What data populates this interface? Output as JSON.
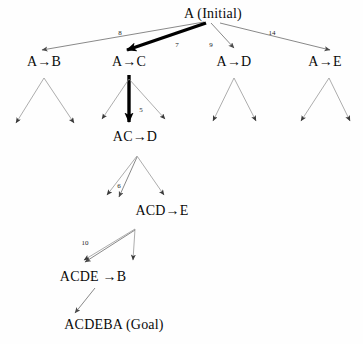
{
  "diagram": {
    "title_node": "A (Initial)",
    "goal_node": "ACDEBA (Goal)",
    "arrow_glyph": "→",
    "colors": {
      "background": "#fefefe",
      "text": "#0a0a0a",
      "thin_edge": "#6b6b6b",
      "bold_edge": "#000000"
    },
    "nodes": [
      {
        "id": "root",
        "label": "A (Initial)",
        "x": 213,
        "y": 14,
        "level": 0
      },
      {
        "id": "n_ab",
        "label": "A→B",
        "x": 44,
        "y": 62,
        "level": 1
      },
      {
        "id": "n_ac",
        "label": "A→C",
        "x": 129,
        "y": 62,
        "level": 1
      },
      {
        "id": "n_ad",
        "label": "A→D",
        "x": 234,
        "y": 62,
        "level": 1
      },
      {
        "id": "n_ae",
        "label": "A→E",
        "x": 325,
        "y": 62,
        "level": 1
      },
      {
        "id": "n_acd",
        "label": "AC→D",
        "x": 135,
        "y": 137,
        "level": 2
      },
      {
        "id": "n_acde",
        "label": "ACD→E",
        "x": 162,
        "y": 211,
        "level": 3
      },
      {
        "id": "n_acdeb",
        "label": "ACDE →B",
        "x": 93,
        "y": 277,
        "level": 4
      },
      {
        "id": "goal",
        "label": "ACDEBA (Goal)",
        "x": 114,
        "y": 325,
        "level": 5
      }
    ],
    "edges": [
      {
        "id": "e_root_ab",
        "from": "root",
        "to": "n_ab",
        "weight": "8",
        "bold": false,
        "lx": 120,
        "ly": 33
      },
      {
        "id": "e_root_ac",
        "from": "root",
        "to": "n_ac",
        "weight": "7",
        "bold": true,
        "lx": 177,
        "ly": 45
      },
      {
        "id": "e_root_ad",
        "from": "root",
        "to": "n_ad",
        "weight": "9",
        "bold": false,
        "lx": 211,
        "ly": 45
      },
      {
        "id": "e_root_ae",
        "from": "root",
        "to": "n_ae",
        "weight": "14",
        "bold": false,
        "lx": 272,
        "ly": 33
      },
      {
        "id": "e_ac_acd",
        "from": "n_ac",
        "to": "n_acd",
        "weight": "5",
        "bold": true,
        "lx": 141,
        "ly": 110
      },
      {
        "id": "e_acd_acde",
        "from": "n_acd",
        "to": "n_acde",
        "weight": "6",
        "bold": false,
        "lx": 119,
        "ly": 186
      },
      {
        "id": "e_acde_b",
        "from": "n_acde",
        "to": "n_acdeb",
        "weight": "10",
        "bold": false,
        "lx": 85,
        "ly": 243
      },
      {
        "id": "e_b_goal",
        "from": "n_acdeb",
        "to": "goal",
        "weight": "",
        "bold": false,
        "lx": 0,
        "ly": 0
      }
    ],
    "leaf_branches": [
      {
        "id": "leaf_ab",
        "apex_x": 44,
        "apex_y": 77,
        "left_x": 15,
        "left_y": 126,
        "right_x": 75,
        "right_y": 126
      },
      {
        "id": "leaf_ac",
        "apex_x": 129,
        "apex_y": 77,
        "left_x": 101,
        "left_y": 122,
        "right_x": 166,
        "right_y": 122
      },
      {
        "id": "leaf_ad",
        "apex_x": 234,
        "apex_y": 77,
        "left_x": 212,
        "left_y": 124,
        "right_x": 257,
        "right_y": 124
      },
      {
        "id": "leaf_ae",
        "apex_x": 329,
        "apex_y": 77,
        "left_x": 300,
        "left_y": 124,
        "right_x": 351,
        "right_y": 124
      },
      {
        "id": "leaf_acd",
        "apex_x": 137,
        "apex_y": 155,
        "left_x": 106,
        "left_y": 198,
        "right_x": 165,
        "right_y": 198
      },
      {
        "id": "leaf_acde",
        "apex_x": 135,
        "apex_y": 228,
        "left_x": 83,
        "left_y": 263,
        "right_x": 134,
        "right_y": 263
      }
    ]
  }
}
